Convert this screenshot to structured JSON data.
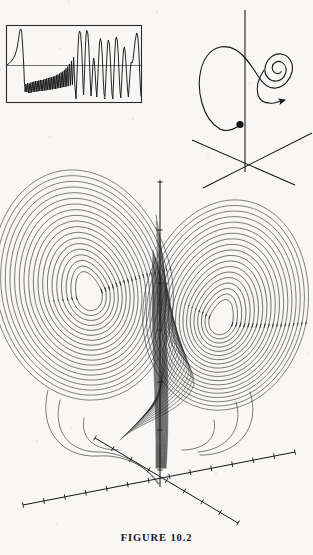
{
  "figure": {
    "caption": "FIGURE  10.2",
    "background_color": "#f8f7f5",
    "ink_color": "#151515"
  },
  "panels": {
    "timeseries_inset": {
      "name": "chaotic time series inset",
      "frame": {
        "x": 6,
        "y": 25,
        "width": 136,
        "height": 78
      },
      "zero_line_y": 65
    },
    "spiral_3d": {
      "name": "3D trajectory with outward spiral and arrow",
      "origin": {
        "x": 245,
        "y": 163
      },
      "start_dot": {
        "x": 240,
        "y": 124,
        "r": 3.6
      },
      "arrow_tip": {
        "x": 283,
        "y": 96
      }
    },
    "attractor": {
      "name": "Lorenz butterfly attractor",
      "left_focus": {
        "x": 88,
        "y": 291
      },
      "right_focus": {
        "x": 222,
        "y": 317
      },
      "origin": {
        "x": 160,
        "y": 485
      }
    }
  },
  "chart_data": {
    "type": "line",
    "title": "FIGURE  10.2",
    "subplots": [
      {
        "id": "timeseries",
        "type": "line",
        "xlabel": "t",
        "ylabel": "x(t)",
        "grid": false,
        "legend": null,
        "xlim": [
          0,
          100
        ],
        "ylim": [
          -20,
          20
        ],
        "zero_line": 0,
        "series": [
          {
            "name": "x(t)",
            "x": [
              0,
              1.2,
              2.4,
              3.2,
              4.0,
              4.6,
              5.0,
              5.4,
              6.0,
              6.6,
              7.2,
              7.8,
              8.4,
              9.0,
              9.6,
              10.2,
              10.8,
              11.4,
              12.0,
              12.6,
              13.2,
              13.8,
              14.4,
              15.0,
              15.6,
              16.2,
              16.8,
              17.4,
              18.0,
              18.6,
              19.2,
              19.8,
              20.4,
              21.0,
              21.6,
              22.2,
              22.8,
              23.4,
              24.0,
              24.6,
              25.2,
              25.8,
              26.4,
              27.0,
              27.6,
              28.2,
              28.8,
              29.4,
              30.0,
              31.0,
              32.0,
              33.0,
              34.0,
              35.0,
              36.0,
              37.0,
              38.0,
              39.0,
              40.0,
              41.0,
              42.0,
              43.0,
              44.0,
              45.0,
              46.0,
              47.0,
              48.0,
              49.0,
              50.0,
              51.0,
              52.0,
              53.0,
              54.0,
              55.0,
              56.0,
              57.0,
              58.0,
              59.0,
              60.0,
              61.0,
              62.0,
              63.0,
              64.0,
              65.0,
              66.0,
              67.0,
              68.0,
              69.0,
              70.0,
              71.0,
              72.0,
              73.0,
              74.0,
              75.0,
              76.0,
              77.0,
              78.0,
              79.0,
              80.0,
              81.0,
              82.0,
              83.0,
              84.0,
              85.0,
              86.0,
              87.0,
              88.0,
              89.0,
              90.0,
              91.0,
              92.0,
              93.0,
              94.0,
              95.0,
              96.0,
              97.0,
              98.0,
              99.0,
              100.0
            ],
            "y": [
              0.2,
              1.0,
              2.2,
              4.0,
              7.5,
              13.0,
              18.5,
              19.2,
              -14.0,
              -9.5,
              -12.5,
              -8.5,
              -12.0,
              -8.0,
              -12.2,
              -8.2,
              -12.4,
              -8.4,
              -12.6,
              -8.6,
              -12.8,
              -8.8,
              -13.0,
              -9.0,
              -13.2,
              -9.2,
              -13.4,
              -9.4,
              -13.6,
              -9.6,
              -13.8,
              -9.8,
              -14.0,
              -10.0,
              -14.2,
              -10.4,
              -14.6,
              -10.8,
              -15.0,
              -11.2,
              -15.6,
              -11.6,
              -16.0,
              -12.0,
              -16.6,
              -12.6,
              -17.2,
              -13.4,
              -18.0,
              16.0,
              18.4,
              2.0,
              17.5,
              -1.0,
              -16.5,
              -14.0,
              -6.0,
              12.0,
              2.0,
              -15.0,
              -16.5,
              -2.0,
              16.5,
              1.0,
              -17.5,
              -16.0,
              14.0,
              17.0,
              5.0,
              -16.0,
              -17.0,
              11.0,
              16.5,
              3.0,
              -15.5,
              -17.5,
              13.0,
              15.5,
              0.0,
              -17.0,
              -15.0,
              15.0,
              17.2,
              12.0,
              14.0,
              1.5,
              -16.0,
              -17.5,
              16.5,
              9.0,
              13.5,
              -2.0,
              -15.0,
              -17.0,
              18.0,
              14.5,
              3.0,
              -16.5,
              -14.0,
              6.0,
              17.5,
              8.0,
              -14.5,
              -17.0,
              16.0,
              18.5,
              4.0,
              -15.5,
              -16.0,
              10.0,
              18.0,
              14.0,
              -13.0,
              -17.5,
              15.0,
              17.0,
              -1.0,
              -14.0
            ]
          }
        ]
      },
      {
        "id": "spiral-trajectory",
        "type": "line",
        "xlabel": "x",
        "ylabel": "z",
        "zlabel": "y",
        "grid": false,
        "legend": null,
        "annotations": [
          {
            "kind": "dot",
            "label": "initial condition",
            "x": 240,
            "y": 124
          },
          {
            "kind": "arrow",
            "label": "direction of flow",
            "x": 283,
            "y": 96
          }
        ]
      },
      {
        "id": "lorenz-attractor",
        "type": "line",
        "xlabel": "x",
        "ylabel": "z",
        "zlabel": "y",
        "grid": false,
        "legend": null,
        "axis_ticks": {
          "vertical": 6,
          "left_oblique": 7,
          "right_oblique": 7,
          "front_oblique": 5
        },
        "description": "two-lobed butterfly attractor, orbits spiralling outward around two foci"
      }
    ]
  }
}
